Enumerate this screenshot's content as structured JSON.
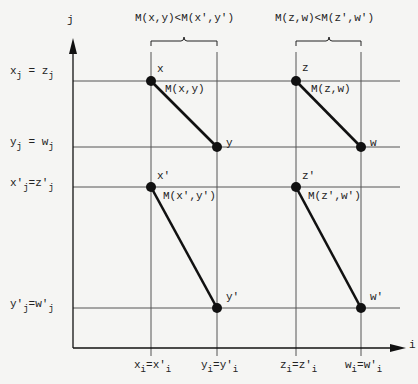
{
  "axes": {
    "y_label": "j",
    "x_label": "i"
  },
  "comparisons": [
    {
      "text": "M(x,y)<M(x',y')"
    },
    {
      "text": "M(z,w)<M(z',w')"
    }
  ],
  "y_ticks": [
    {
      "base": "x",
      "sub": "j",
      "mid": " = ",
      "base2": "z",
      "sub2": "j"
    },
    {
      "base": "y",
      "sub": "j",
      "mid": " = ",
      "base2": "w",
      "sub2": "j"
    },
    {
      "base": "x'",
      "sub": "j",
      "mid": "=",
      "base2": "z'",
      "sub2": "j"
    },
    {
      "base": "y'",
      "sub": "j",
      "mid": "=",
      "base2": "w'",
      "sub2": "j"
    }
  ],
  "x_ticks": [
    {
      "base": "x",
      "sub": "i",
      "mid": "=",
      "base2": "x'",
      "sub2": "i"
    },
    {
      "base": "y",
      "sub": "i",
      "mid": "=",
      "base2": "y'",
      "sub2": "i"
    },
    {
      "base": "z",
      "sub": "i",
      "mid": "=",
      "base2": "z'",
      "sub2": "i"
    },
    {
      "base": "w",
      "sub": "i",
      "mid": "=",
      "base2": "w'",
      "sub2": "i"
    }
  ],
  "points": {
    "x": "x",
    "y": "y",
    "z": "z",
    "w": "w",
    "xp": "x'",
    "yp": "y'",
    "zp": "z'",
    "wp": "w'"
  },
  "segments": [
    {
      "label": "M(x,y)"
    },
    {
      "label": "M(z,w)"
    },
    {
      "label": "M(x',y')"
    },
    {
      "label": "M(z',w')"
    }
  ],
  "colors": {
    "ink": "#111111",
    "grid": "#555555",
    "background": "#f5f5f3"
  }
}
